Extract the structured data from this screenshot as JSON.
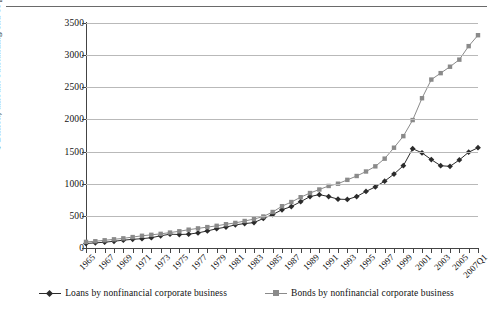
{
  "chart_data": {
    "type": "line",
    "title": "",
    "xlabel": "",
    "ylabel": "$ Billion, amount outstanding end of period",
    "ylim": [
      0,
      3500
    ],
    "yticks": [
      0,
      500,
      1000,
      1500,
      2000,
      2500,
      3000,
      3500
    ],
    "grid": true,
    "legend_position": "bottom",
    "x": [
      "1965",
      "1966",
      "1967",
      "1968",
      "1969",
      "1970",
      "1971",
      "1972",
      "1973",
      "1974",
      "1975",
      "1976",
      "1977",
      "1978",
      "1979",
      "1980",
      "1981",
      "1982",
      "1983",
      "1984",
      "1985",
      "1986",
      "1987",
      "1988",
      "1989",
      "1990",
      "1991",
      "1992",
      "1993",
      "1994",
      "1995",
      "1996",
      "1997",
      "1998",
      "1999",
      "2000",
      "2001",
      "2002",
      "2003",
      "2004",
      "2005",
      "2006",
      "2007Q1"
    ],
    "xtick_labels": [
      "1965",
      "1967",
      "1969",
      "1971",
      "1973",
      "1975",
      "1977",
      "1979",
      "1981",
      "1983",
      "1985",
      "1987",
      "1989",
      "1991",
      "1993",
      "1995",
      "1997",
      "1999",
      "2001",
      "2003",
      "2005",
      "2007Q1"
    ],
    "series": [
      {
        "name": "Loans by nonfinancial corporate business",
        "color": "#2b2b2b",
        "marker": "diamond",
        "values": [
          70,
          80,
          90,
          105,
          122,
          135,
          145,
          160,
          190,
          215,
          210,
          215,
          235,
          265,
          300,
          325,
          360,
          380,
          395,
          460,
          520,
          595,
          645,
          720,
          800,
          830,
          800,
          760,
          755,
          800,
          880,
          950,
          1040,
          1150,
          1280,
          1545,
          1480,
          1375,
          1280,
          1270,
          1370,
          1490,
          1560
        ]
      },
      {
        "name": "Bonds by nonfinancial corporate business",
        "color": "#8a8a8a",
        "marker": "square",
        "values": [
          95,
          105,
          120,
          135,
          150,
          170,
          190,
          205,
          220,
          240,
          260,
          285,
          305,
          325,
          345,
          370,
          390,
          420,
          450,
          490,
          560,
          650,
          715,
          790,
          855,
          910,
          965,
          1000,
          1060,
          1120,
          1190,
          1270,
          1390,
          1560,
          1740,
          1990,
          2330,
          2620,
          2720,
          2820,
          2930,
          3140,
          3310
        ]
      }
    ]
  },
  "legend": {
    "items": [
      {
        "label": "Loans by nonfinancial corporate business"
      },
      {
        "label": "Bonds by nonfinancial corporate business"
      }
    ]
  }
}
